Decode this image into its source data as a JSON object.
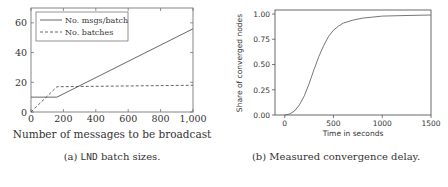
{
  "chart_data": [
    {
      "type": "line",
      "title": "",
      "xlabel": "Number of messages to be broadcast",
      "ylabel": "",
      "xlim": [
        0,
        1000
      ],
      "ylim": [
        0,
        70
      ],
      "xticks": [
        0,
        200,
        400,
        600,
        800,
        1000
      ],
      "xtick_labels": [
        "0",
        "200",
        "400",
        "600",
        "800",
        "1,000"
      ],
      "yticks": [
        0,
        20,
        40,
        60
      ],
      "ytick_labels": [
        "0",
        "20",
        "40",
        "60"
      ],
      "grid": false,
      "legend_position": "upper left",
      "series": [
        {
          "name": "No. msgs/batch",
          "style": "solid",
          "x": [
            0,
            160,
            1000
          ],
          "values": [
            10,
            10,
            56
          ]
        },
        {
          "name": "No. batches",
          "style": "dashed",
          "x": [
            0,
            160,
            1000
          ],
          "values": [
            0,
            17,
            18
          ]
        }
      ],
      "caption": {
        "prefix": "(a) ",
        "code": "LND",
        "suffix": " batch sizes."
      }
    },
    {
      "type": "line",
      "title": "",
      "xlabel": "Time in seconds",
      "ylabel": "Share of converged nodes",
      "xlim": [
        -100,
        1500
      ],
      "ylim": [
        0,
        1.04
      ],
      "xticks": [
        0,
        500,
        1000,
        1500
      ],
      "xtick_labels": [
        "0",
        "500",
        "1000",
        "1500"
      ],
      "yticks": [
        0,
        0.25,
        0.5,
        0.75,
        1.0
      ],
      "ytick_labels": [
        "0.00",
        "0.25",
        "0.50",
        "0.75",
        "1.00"
      ],
      "grid": false,
      "series": [
        {
          "name": "Share of converged nodes",
          "style": "solid",
          "x": [
            0,
            50,
            100,
            150,
            200,
            250,
            300,
            350,
            400,
            450,
            500,
            550,
            600,
            700,
            800,
            900,
            1000,
            1200,
            1500
          ],
          "values": [
            0.0,
            0.01,
            0.04,
            0.1,
            0.19,
            0.31,
            0.45,
            0.58,
            0.69,
            0.78,
            0.84,
            0.88,
            0.91,
            0.94,
            0.96,
            0.97,
            0.98,
            0.985,
            0.99
          ]
        }
      ],
      "caption": {
        "text": "(b) Measured convergence delay."
      }
    }
  ]
}
